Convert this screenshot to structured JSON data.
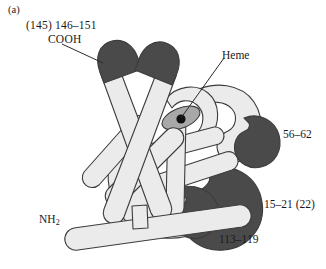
{
  "figure": {
    "panel_letter": "(a)",
    "background_color": "#ffffff"
  },
  "colors": {
    "helix_light_fill": "#ebebeb",
    "helix_dark_fill": "#4a4a4a",
    "heme_fill": "#a8a8a8",
    "iron_dot": "#111111",
    "outline": "#3c3c3c",
    "text": "#1a1a1a",
    "leader_line": "#2b2b2b"
  },
  "labels": {
    "cooh_range": "(145) 146–151",
    "cooh": "COOH",
    "heme": "Heme",
    "segment_56_62": "56–62",
    "segment_15_21": "15–21 (22)",
    "segment_113_119": "113–119",
    "nh2_text": "NH",
    "nh2_subscript": "2"
  },
  "leaders": [
    {
      "name": "cooh-leader",
      "from": [
        62,
        44
      ],
      "to": [
        103,
        62
      ]
    },
    {
      "name": "heme-leader",
      "from": [
        224,
        57
      ],
      "to": [
        182,
        118
      ]
    }
  ],
  "elements": {
    "heme_group": {
      "name": "heme-ellipse",
      "center": [
        181,
        118
      ],
      "rx": 20,
      "ry": 10,
      "rotation_deg": -22,
      "iron_center": [
        181,
        119
      ],
      "iron_radius": 4.6
    }
  }
}
